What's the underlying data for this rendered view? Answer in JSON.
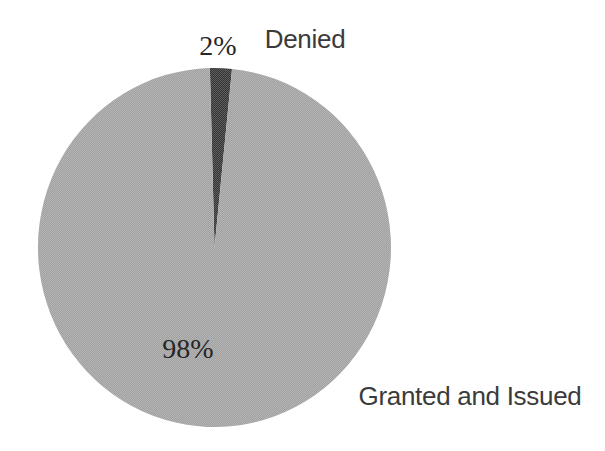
{
  "chart_data": {
    "type": "pie",
    "title": "",
    "slices": [
      {
        "label": "Denied",
        "value": 2,
        "percent_label": "2%",
        "color": "#333333"
      },
      {
        "label": "Granted and Issued",
        "value": 98,
        "percent_label": "98%",
        "color": "#a0a0a0"
      }
    ],
    "start_angle_deg": -1.5,
    "legend_position": "none",
    "data_labels": "percent inside/above slice, category name outside",
    "background_color": "#ffffff",
    "label_colors": {
      "percent": "#262626",
      "category": "#3b3b3b"
    }
  }
}
